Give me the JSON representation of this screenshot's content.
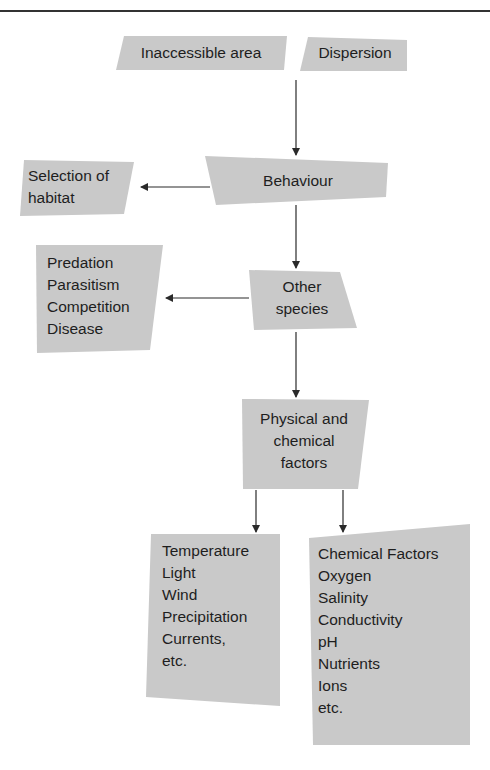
{
  "diagram": {
    "type": "flowchart",
    "fill_color": "#c8c8c8",
    "line_color": "#2a2a2a",
    "nodes": {
      "inaccessible": {
        "label": "Inaccessible area"
      },
      "dispersion": {
        "label": "Dispersion"
      },
      "behaviour": {
        "label": "Behaviour"
      },
      "habitat": {
        "lines": [
          "Selection of",
          "habitat"
        ]
      },
      "other_species": {
        "lines": [
          "Other",
          "species"
        ]
      },
      "interactions": {
        "lines": [
          "Predation",
          "Parasitism",
          "Competition",
          "Disease"
        ]
      },
      "physchem": {
        "lines": [
          "Physical and",
          "chemical",
          "factors"
        ]
      },
      "physical_list": {
        "lines": [
          "Temperature",
          "Light",
          "Wind",
          "Precipitation",
          "Currents,",
          "etc."
        ]
      },
      "chemical_list": {
        "lines": [
          "Chemical Factors",
          "Oxygen",
          "Salinity",
          "Conductivity",
          "pH",
          "Nutrients",
          "Ions",
          "etc."
        ]
      }
    },
    "edges": [
      {
        "from": "inaccessible/dispersion",
        "to": "behaviour"
      },
      {
        "from": "behaviour",
        "to": "habitat"
      },
      {
        "from": "behaviour",
        "to": "other_species"
      },
      {
        "from": "other_species",
        "to": "interactions"
      },
      {
        "from": "other_species",
        "to": "physchem"
      },
      {
        "from": "physchem",
        "to": "physical_list"
      },
      {
        "from": "physchem",
        "to": "chemical_list"
      }
    ]
  }
}
